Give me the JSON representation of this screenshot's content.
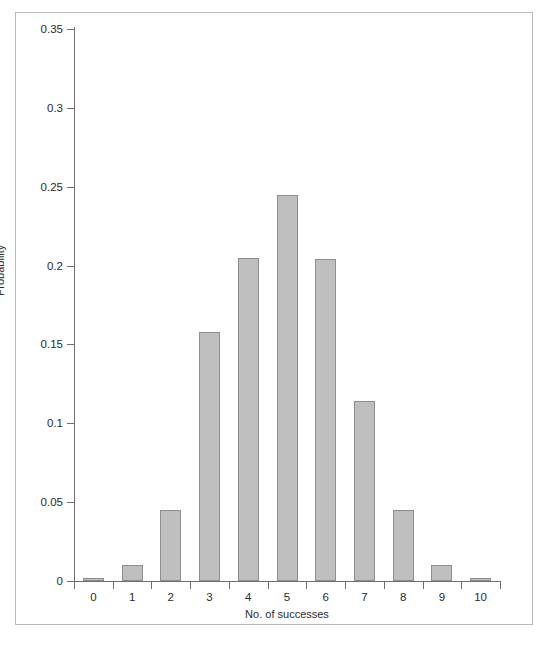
{
  "chart_data": {
    "type": "bar",
    "title": "",
    "xlabel": "No. of successes",
    "ylabel": "Probability",
    "categories": [
      "0",
      "1",
      "2",
      "3",
      "4",
      "5",
      "6",
      "7",
      "8",
      "9",
      "10"
    ],
    "values": [
      0.001,
      0.01,
      0.045,
      0.158,
      0.205,
      0.245,
      0.204,
      0.114,
      0.045,
      0.01,
      0.001
    ],
    "ylim": [
      0,
      0.35
    ],
    "ytick_labels": [
      "0",
      "0.05",
      "0.1",
      "0.15",
      "0.2",
      "0.25",
      "0.3",
      "0.35"
    ],
    "ytick_values": [
      0,
      0.05,
      0.1,
      0.15,
      0.2,
      0.25,
      0.3,
      0.35
    ],
    "xtick_labels": [
      "0",
      "1",
      "2",
      "3",
      "4",
      "5",
      "6",
      "7",
      "8",
      "9",
      "10"
    ],
    "grid": false,
    "legend": null,
    "bar_color": "#bfbfbf",
    "bar_border_color": "#8e8e8e",
    "axis_color": "#6f6f6f",
    "frame_color": "#b9b9b9",
    "text_color": "#2b2b2b"
  }
}
